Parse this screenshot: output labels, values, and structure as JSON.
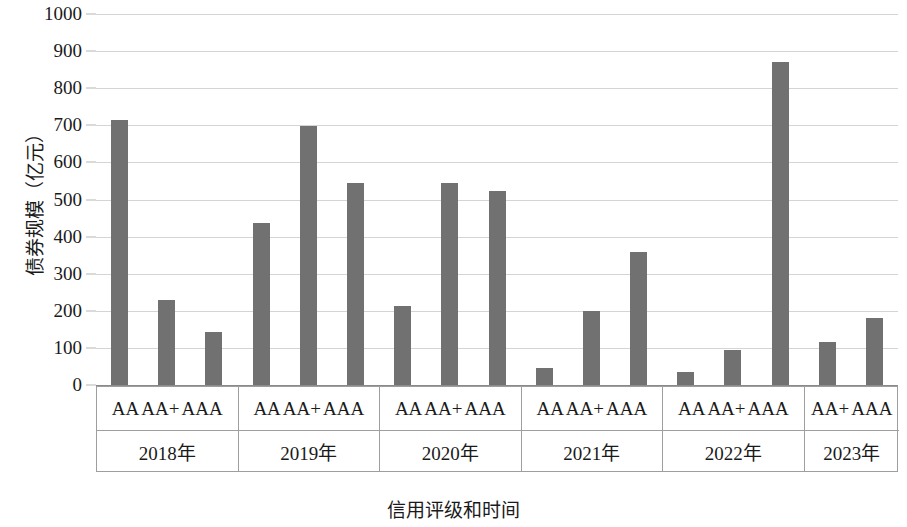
{
  "chart_data": {
    "type": "bar",
    "title": "",
    "subtitle": "",
    "xlabel": "信用评级和时间",
    "ylabel": "债券规模（亿元）",
    "ylim": [
      0,
      1000
    ],
    "y_ticks": [
      0,
      100,
      200,
      300,
      400,
      500,
      600,
      700,
      800,
      900,
      1000
    ],
    "grid": true,
    "legend": "none",
    "bar_color": "#717171",
    "gridline_color": "#d4d4d4",
    "axis_color": "#9e9e9e",
    "groups": [
      {
        "year": "2018年",
        "ratings": [
          "AA",
          "AA+",
          "AAA"
        ],
        "values": [
          713,
          228,
          143
        ]
      },
      {
        "year": "2019年",
        "ratings": [
          "AA",
          "AA+",
          "AAA"
        ],
        "values": [
          437,
          697,
          545
        ]
      },
      {
        "year": "2020年",
        "ratings": [
          "AA",
          "AA+",
          "AAA"
        ],
        "values": [
          213,
          545,
          522
        ]
      },
      {
        "year": "2021年",
        "ratings": [
          "AA",
          "AA+",
          "AAA"
        ],
        "values": [
          45,
          200,
          358
        ]
      },
      {
        "year": "2022年",
        "ratings": [
          "AA",
          "AA+",
          "AAA"
        ],
        "values": [
          35,
          95,
          870
        ]
      },
      {
        "year": "2023年",
        "ratings": [
          "AA+",
          "AAA"
        ],
        "values": [
          117,
          180
        ]
      }
    ],
    "categories": [
      "2018 AA",
      "2018 AA+",
      "2018 AAA",
      "2019 AA",
      "2019 AA+",
      "2019 AAA",
      "2020 AA",
      "2020 AA+",
      "2020 AAA",
      "2021 AA",
      "2021 AA+",
      "2021 AAA",
      "2022 AA",
      "2022 AA+",
      "2022 AAA",
      "2023 AA+",
      "2023 AAA"
    ],
    "values": [
      713,
      228,
      143,
      437,
      697,
      545,
      213,
      545,
      522,
      45,
      200,
      358,
      35,
      95,
      870,
      117,
      180
    ]
  }
}
